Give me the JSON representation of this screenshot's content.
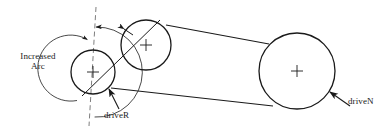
{
  "figure": {
    "kind": "belt-drive-schematic",
    "background_color": "#ffffff",
    "stroke_color": "#1a1a1a",
    "width": 389,
    "height": 132
  },
  "labels": {
    "increased_arc": "Increased\nArc",
    "increased_arc_line1": "Increased",
    "increased_arc_line2": "Arc",
    "driver": "driveR",
    "driven": "driveN"
  },
  "pulleys": [
    {
      "name": "driveR",
      "cx": 93,
      "cy": 72,
      "r": 22,
      "label": "driveR",
      "center_mark": "plus"
    },
    {
      "name": "idler",
      "cx": 146,
      "cy": 45,
      "r": 25,
      "label": "",
      "center_mark": "plus"
    },
    {
      "name": "driveN",
      "cx": 297,
      "cy": 71,
      "r": 38,
      "label": "driveN",
      "center_mark": "plus"
    }
  ],
  "arcs": [
    {
      "name": "inner-arc",
      "cx": 93,
      "cy": 72,
      "r": 33,
      "start_deg": 268,
      "end_deg": 100,
      "arrow": "start"
    },
    {
      "name": "outer-arc",
      "cx": 93,
      "cy": 72,
      "r": 45,
      "start_deg": 272,
      "end_deg": 86,
      "arrow": "end"
    }
  ],
  "centerline": {
    "name": "dashed-centerline",
    "x1": 96,
    "y1": 7,
    "x2": 89,
    "y2": 126,
    "style": "dashed"
  },
  "belts": [
    {
      "name": "belt-upper",
      "from": "idler",
      "to": "driveN",
      "x1": 167,
      "y1": 25,
      "x2": 268,
      "y2": 44
    },
    {
      "name": "belt-lower",
      "from": "driveR",
      "to": "driveN",
      "x1": 112,
      "y1": 88,
      "x2": 272,
      "y2": 105
    },
    {
      "name": "belt-wrap-left",
      "from": "driveR",
      "to": "idler",
      "x1": 83,
      "y1": 94,
      "x2": 158,
      "y2": 21
    }
  ],
  "leaders": [
    {
      "name": "driver-leader",
      "x1": 118,
      "y1": 108,
      "x2": 108,
      "y2": 88,
      "label": "driveR"
    },
    {
      "name": "driven-leader",
      "x1": 348,
      "y1": 105,
      "x2": 329,
      "y2": 93,
      "label": "driveN"
    }
  ]
}
